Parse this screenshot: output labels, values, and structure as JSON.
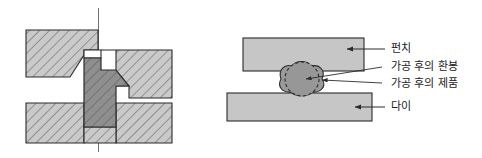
{
  "figure": {
    "title": "",
    "width": 482,
    "height": 158,
    "background": "#ffffff"
  },
  "colors": {
    "hatch_block_fill": "#c8c8c8",
    "hatch_line": "#5a5a5a",
    "workpiece_fill": "#8c8c8c",
    "tool_fill": "#c4c4c4",
    "billet_fill": "#9a9a9a",
    "outline": "#2b2b2b",
    "centerline": "#6e6e6e",
    "leader_line": "#3a3a3a",
    "text": "#1a1a1a"
  },
  "left_diagram": {
    "name": "die-assembly-section",
    "centerline_label": "",
    "parts": [
      {
        "id": "upper-left-die",
        "label": ""
      },
      {
        "id": "upper-right-die",
        "label": ""
      },
      {
        "id": "lower-left-die",
        "label": ""
      },
      {
        "id": "lower-right-die",
        "label": ""
      },
      {
        "id": "workpiece",
        "label": ""
      }
    ]
  },
  "right_diagram": {
    "name": "upsetting-schematic",
    "parts": [
      {
        "id": "punch-block",
        "label": ""
      },
      {
        "id": "die-block",
        "label": ""
      },
      {
        "id": "round-bar",
        "label": ""
      },
      {
        "id": "formed-product",
        "label": ""
      }
    ],
    "labels": [
      {
        "id": "punch",
        "text": "펀치"
      },
      {
        "id": "round-bar-after-forming",
        "text": "가공 후의 환봉"
      },
      {
        "id": "product-after-forming",
        "text": "가공 후의 제품"
      },
      {
        "id": "die",
        "text": "다이"
      }
    ]
  }
}
